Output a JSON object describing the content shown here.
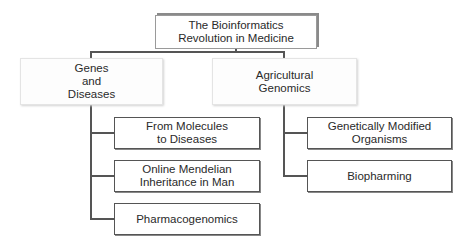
{
  "diagram": {
    "root": {
      "label": "The Bioinformatics\nRevolution in Medicine"
    },
    "categories": [
      {
        "label": "Genes\nand\nDiseases",
        "children": [
          {
            "label": "From Molecules\nto Diseases"
          },
          {
            "label": "Online Mendelian\nInheritance in Man"
          },
          {
            "label": "Pharmacogenomics"
          }
        ]
      },
      {
        "label": "Agricultural\nGenomics",
        "children": [
          {
            "label": "Genetically Modified\nOrganisms"
          },
          {
            "label": "Biopharming"
          }
        ]
      }
    ]
  },
  "colors": {
    "line": "#555555",
    "border": "#555555",
    "background": "#ffffff"
  }
}
